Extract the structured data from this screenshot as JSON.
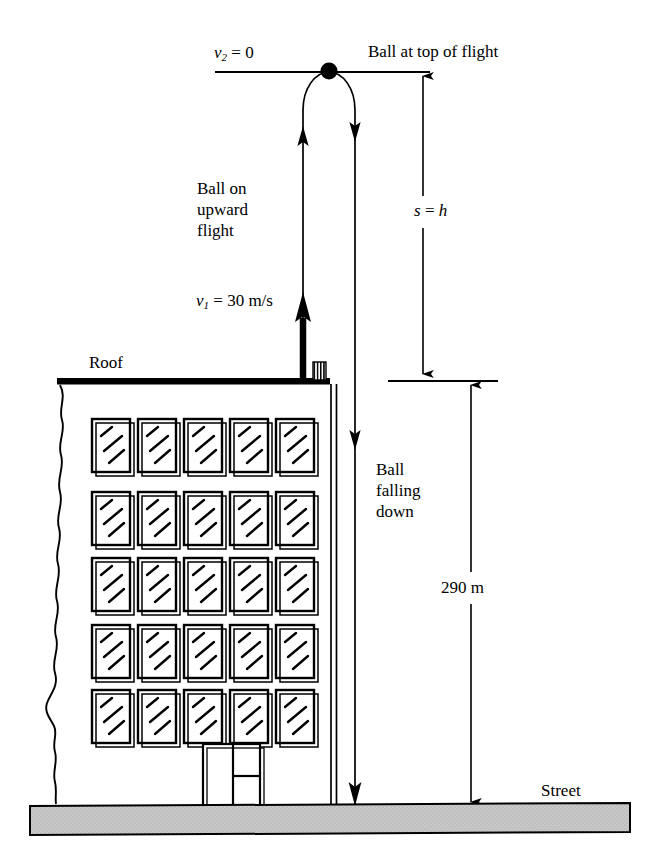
{
  "figure": {
    "kind": "physics-free-body-diagram",
    "background_color": "#ffffff",
    "ink_color": "#000000",
    "street_fill_color": "#c8c8c8"
  },
  "labels": {
    "v2_zero": "v₂ = 0",
    "v2_symbol": "v",
    "v2_subscript": "2",
    "v2_value": " = 0",
    "ball_at_top": "Ball at top of flight",
    "ball_upward": "Ball on\nupward\nflight",
    "v1_symbol": "v",
    "v1_subscript": "1",
    "v1_value": " = 30 m/s",
    "v1_full": "v₁ = 30 m/s",
    "s_equals_h": "s = h",
    "s_symbol": "s",
    "s_value": " = ",
    "h_symbol": "h",
    "roof": "Roof",
    "ball_falling": "Ball\nfalling\ndown",
    "height_290": "290 m",
    "street": "Street"
  },
  "measurements": {
    "initial_velocity": "30 m/s",
    "top_velocity": "0",
    "building_height": "290 m",
    "rise_height_symbol": "s = h"
  },
  "geometry": {
    "top_reference_line": {
      "x1": 215,
      "y1": 72,
      "x2": 430,
      "y2": 72
    },
    "roof_line": {
      "x1": 57,
      "y1": 381,
      "x2": 330,
      "y2": 381,
      "thickness": 6
    },
    "street_slab": {
      "x": 30,
      "y": 803,
      "width": 600,
      "height": 30
    },
    "building_left_edge": "torn-wavy",
    "building_right_wall_x": 333,
    "upward_path_x": 303,
    "downward_path_x": 355,
    "apex_y": 72,
    "dimension_s_x": 423,
    "dimension_290_x": 471
  },
  "windows": {
    "rows": 5,
    "columns": 5,
    "glint_count": 3
  },
  "door": {
    "panels": 2,
    "right_panel_divider": true
  },
  "icons": {
    "ball": "filled-circle-ball-icon",
    "chimney": "roof-vent-icon",
    "arrow_up": "arrow-up-icon",
    "arrow_down": "arrow-down-icon"
  }
}
